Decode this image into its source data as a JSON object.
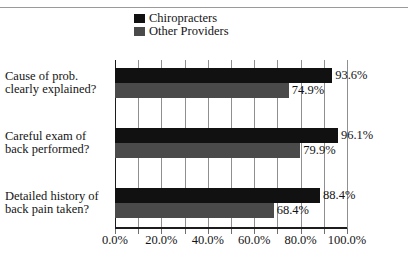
{
  "chart_data": {
    "type": "bar",
    "orientation": "horizontal",
    "title": "",
    "subtitle": "",
    "xlabel": "",
    "ylabel": "",
    "categories": [
      "Cause of prob. clearly explained?",
      "Careful exam of back performed?",
      "Detailed history of back pain taken?"
    ],
    "category_lines": [
      [
        "Cause of prob.",
        "clearly explained?"
      ],
      [
        "Careful exam of",
        "back performed?"
      ],
      [
        "Detailed history of",
        "back pain taken?"
      ]
    ],
    "series": [
      {
        "name": "Chiropracters",
        "color": "#111111",
        "values": [
          93.6,
          96.1,
          88.4
        ],
        "labels": [
          "93.6%",
          "96.1%",
          "88.4%"
        ]
      },
      {
        "name": "Other Providers",
        "color": "#4a4a4a",
        "values": [
          74.9,
          79.9,
          68.4
        ],
        "labels": [
          "74.9%",
          "79.9%",
          "68.4%"
        ]
      }
    ],
    "xlim": [
      0,
      100
    ],
    "xticks": [
      0,
      20,
      40,
      60,
      80,
      100
    ],
    "xtick_labels": [
      "0.0%",
      "20.0%",
      "40.0%",
      "60.0%",
      "80.0%",
      "100.0%"
    ],
    "minor_gridlines_step": 10,
    "grid": true,
    "legend_position": "top-center",
    "value_labels": true
  },
  "legend": {
    "entries": [
      {
        "label": "Chiropracters",
        "color": "#111111",
        "swatch": "legend-swatch-chiropracters"
      },
      {
        "label": "Other Providers",
        "color": "#4a4a4a",
        "swatch": "legend-swatch-other-providers"
      }
    ]
  },
  "axis": {
    "x_labels": [
      "0.0%",
      "20.0%",
      "40.0%",
      "60.0%",
      "80.0%",
      "100.0%"
    ]
  },
  "categories": {
    "c0_line1": "Cause of prob.",
    "c0_line2": "clearly explained?",
    "c1_line1": "Careful exam of",
    "c1_line2": "back performed?",
    "c2_line1": "Detailed history of",
    "c2_line2": "back pain taken?"
  },
  "values": {
    "g0_s0": "93.6%",
    "g0_s1": "74.9%",
    "g1_s0": "96.1%",
    "g1_s1": "79.9%",
    "g2_s0": "88.4%",
    "g2_s1": "68.4%"
  }
}
